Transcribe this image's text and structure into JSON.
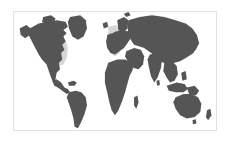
{
  "figure": {
    "kind": "world-map",
    "title": "",
    "caption": "",
    "background_color": "#ffffff",
    "frame": {
      "visible": true,
      "border_color": "#e2e2e2",
      "border_width_px": 1,
      "x": 13,
      "y": 11,
      "width": 204,
      "height": 120
    }
  },
  "map": {
    "projection": "equirectangular",
    "lon_range": [
      -180,
      180
    ],
    "lat_range": [
      -60,
      84
    ],
    "ocean_color": "#ffffff",
    "land_color": "#555555",
    "highlight_color": "#d6d6d6",
    "graticule": false,
    "labels": [],
    "legend": {
      "visible": false,
      "entries": []
    }
  },
  "regions": [
    {
      "name": "world-landmass",
      "role": "base-land",
      "color": "#555555",
      "label": ""
    },
    {
      "name": "north-america-east-highlight",
      "role": "highlight",
      "color": "#d6d6d6",
      "label": ""
    },
    {
      "name": "western-europe-highlight",
      "role": "highlight",
      "color": "#d6d6d6",
      "label": ""
    }
  ],
  "chart_data": {
    "type": "heatmap",
    "title": "",
    "xlabel": "",
    "ylabel": "",
    "categories": [
      "world-landmass",
      "north-america-east-highlight",
      "western-europe-highlight"
    ],
    "values": [
      0,
      1,
      1
    ],
    "colors": [
      "#555555",
      "#d6d6d6",
      "#d6d6d6"
    ],
    "legend_position": "none",
    "grid": false
  }
}
